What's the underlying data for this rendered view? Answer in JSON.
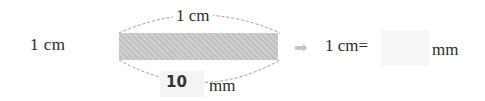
{
  "left_label": "1 cm",
  "diagram": {
    "top_label": "1 cm",
    "bottom_answer": "10",
    "bottom_unit": "mm",
    "bar_color": "#c8c8c8"
  },
  "equation": {
    "arrow_icon": "➡",
    "lhs": "1 cm=",
    "blank_value": "",
    "unit": "mm"
  }
}
